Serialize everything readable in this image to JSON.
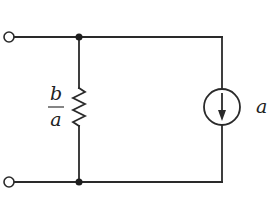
{
  "diagram": {
    "type": "circuit",
    "terminals": [
      {
        "id": "top-left",
        "x": 9,
        "y": 37
      },
      {
        "id": "bottom-left",
        "x": 9,
        "y": 182
      }
    ],
    "nodes": [
      {
        "id": "top-node",
        "x": 79,
        "y": 37
      },
      {
        "id": "bottom-node",
        "x": 79,
        "y": 182
      }
    ],
    "resistor": {
      "label_numerator": "b",
      "label_denominator": "a",
      "x": 79,
      "y_top": 90,
      "y_bottom": 128
    },
    "current_source": {
      "label": "a",
      "direction": "down",
      "cx": 222,
      "cy": 107,
      "r": 18
    },
    "colors": {
      "line": "#2a2a2a",
      "background": "#ffffff"
    }
  }
}
